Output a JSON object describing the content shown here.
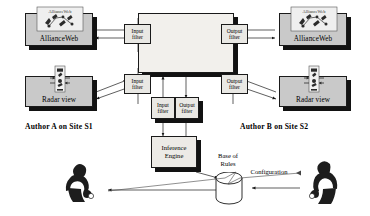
{
  "diagram": {
    "title_center": "Distributed Event Manager",
    "nodes": {
      "alliance_web_left": {
        "label": "AllianceWeb",
        "icon": "allianceweb-thumbnail-icon"
      },
      "alliance_web_right": {
        "label": "AllianceWeb",
        "icon": "allianceweb-thumbnail-icon"
      },
      "radar_view_left": {
        "label": "Radar view",
        "icon": "radar-view-thumbnail-icon"
      },
      "radar_view_right": {
        "label": "Radar view",
        "icon": "radar-view-thumbnail-icon"
      },
      "inference_engine": {
        "line1": "Inference",
        "line2": "Engine"
      },
      "base_of_rules": {
        "line1": "Base of",
        "line2": "Rules"
      }
    },
    "filters": {
      "input_top_left": {
        "line1": "Input",
        "line2": "filter"
      },
      "input_bottom_left": {
        "line1": "Input",
        "line2": "filter"
      },
      "output_top_right": {
        "line1": "Output",
        "line2": "filter"
      },
      "output_bottom_right": {
        "line1": "Output",
        "line2": "filter"
      },
      "input_center": {
        "line1": "Input",
        "line2": "filter"
      },
      "output_center": {
        "line1": "Output",
        "line2": "filter"
      }
    },
    "captions": {
      "author_a": "Author A on Site S1",
      "author_b": "Author B on Site S2",
      "configuration": "Configuration"
    },
    "actors": {
      "author_a_figure": "person-silhouette-icon",
      "author_b_figure": "person-silhouette-icon"
    },
    "colors": {
      "app_fill": "#c9c9c9",
      "dem_fill": "#f2f0ec",
      "filter_fill": "#e9e8e4",
      "stroke": "#1a1a1a",
      "shadow": "#121212"
    }
  }
}
